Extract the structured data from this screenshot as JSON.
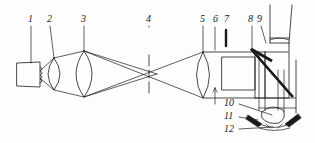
{
  "figure": {
    "type": "optical-ray-diagram",
    "width": 315,
    "height": 143,
    "background_color": "#fdfdfd",
    "ink_color": "#1a1a1a"
  },
  "callouts": [
    {
      "id": "1",
      "label": "1",
      "x": 28,
      "y": 14,
      "target": "light-source"
    },
    {
      "id": "2",
      "label": "2",
      "x": 47,
      "y": 14,
      "target": "condenser-lens"
    },
    {
      "id": "3",
      "label": "3",
      "x": 81,
      "y": 14,
      "target": "collector-lens"
    },
    {
      "id": "4",
      "label": "4",
      "x": 146,
      "y": 14,
      "target": "aperture-slit"
    },
    {
      "id": "5",
      "label": "5",
      "x": 200,
      "y": 14,
      "target": "projection-lens"
    },
    {
      "id": "6",
      "label": "6",
      "x": 213,
      "y": 14,
      "target": "diaphragm"
    },
    {
      "id": "7",
      "label": "7",
      "x": 226,
      "y": 14,
      "target": "slit-blade"
    },
    {
      "id": "8",
      "label": "8",
      "x": 249,
      "y": 14,
      "target": "upper-mirror"
    },
    {
      "id": "9",
      "label": "9",
      "x": 258,
      "y": 14,
      "target": "observation-tube"
    },
    {
      "id": "10",
      "label": "10",
      "x": 224,
      "y": 101,
      "target": "lower-prism"
    },
    {
      "id": "11",
      "label": "11",
      "x": 224,
      "y": 114,
      "target": "left-wedge-mirror"
    },
    {
      "id": "12",
      "label": "12",
      "x": 224,
      "y": 127,
      "target": "eye-specimen"
    }
  ],
  "components": [
    {
      "name": "light-source",
      "number": "1"
    },
    {
      "name": "condenser-lens",
      "number": "2"
    },
    {
      "name": "collector-lens",
      "number": "3"
    },
    {
      "name": "aperture-slit",
      "number": "4"
    },
    {
      "name": "projection-lens",
      "number": "5"
    },
    {
      "name": "diaphragm",
      "number": "6"
    },
    {
      "name": "slit-blade",
      "number": "7"
    },
    {
      "name": "upper-mirror",
      "number": "8"
    },
    {
      "name": "observation-tube",
      "number": "9"
    },
    {
      "name": "lower-prism",
      "number": "10"
    },
    {
      "name": "left-wedge-mirror",
      "number": "11"
    },
    {
      "name": "eye-specimen",
      "number": "12"
    }
  ]
}
